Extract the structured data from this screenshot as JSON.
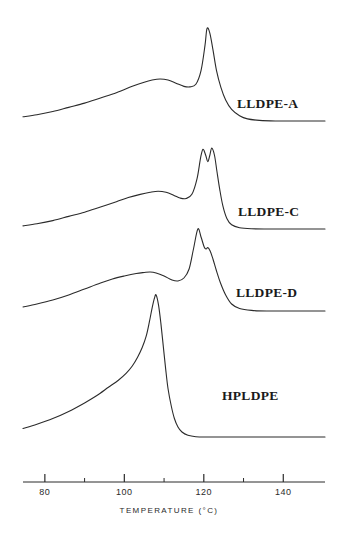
{
  "figure": {
    "title": "",
    "background_color": "#ffffff",
    "curve_color": "#2b2b2b",
    "axis_color": "#2b2b2b"
  },
  "axis": {
    "label": "TEMPERATURE (°C)",
    "major_ticks": [
      80,
      100,
      120,
      140
    ],
    "major_tick_labels": [
      "80",
      "100",
      "120",
      "140"
    ],
    "minor_ticks": [
      90,
      110,
      130
    ],
    "range": [
      74.5,
      150.5
    ]
  },
  "labels": {
    "lldpe_a": "LLDPE-A",
    "lldpe_c": "LLDPE-C",
    "lldpe_d": "LLDPE-D",
    "hpldpe": "HPLDPE"
  },
  "chart_data": {
    "type": "line",
    "title": "",
    "xlabel": "TEMPERATURE (°C)",
    "ylabel": "",
    "xlim": [
      74.5,
      150.5
    ],
    "grid": false,
    "legend": "inline-right",
    "series": [
      {
        "name": "LLDPE-A",
        "label_position": [
          115.5,
          0.0
        ],
        "peaks": [
          {
            "type": "broad-shoulder",
            "temperature": 109.0
          },
          {
            "type": "main",
            "temperature": 120.8
          }
        ],
        "x": [
          74.5,
          78,
          82,
          86,
          90,
          94,
          98,
          102,
          105,
          107,
          109,
          111,
          113,
          115,
          116.5,
          118,
          119.3,
          120.3,
          120.8,
          121.5,
          122.3,
          123.2,
          124.3,
          125.5,
          127,
          129,
          131,
          134,
          138,
          142,
          146,
          150.5
        ],
        "y": [
          4,
          6,
          9,
          13,
          17,
          22,
          27,
          33,
          37,
          39,
          40,
          39,
          36,
          33,
          32.5,
          35,
          48,
          72,
          88,
          84,
          68,
          48,
          32,
          20,
          11,
          5,
          2,
          0.6,
          0,
          0,
          0,
          0
        ]
      },
      {
        "name": "LLDPE-C",
        "label_position": [
          115.8,
          0.0
        ],
        "peaks": [
          {
            "type": "broad-shoulder",
            "temperature": 108.5
          },
          {
            "type": "doublet-low",
            "temperature": 119.8
          },
          {
            "type": "doublet-high",
            "temperature": 122.0
          }
        ],
        "x": [
          74.5,
          78,
          82,
          86,
          90,
          94,
          98,
          101,
          104,
          106.5,
          108.5,
          110.5,
          112.5,
          114,
          115.5,
          117,
          118.3,
          119.2,
          119.8,
          120.5,
          121.0,
          121.5,
          122.0,
          122.7,
          123.3,
          124.0,
          124.8,
          125.8,
          127,
          129,
          132,
          136,
          140,
          145,
          150.5
        ],
        "y": [
          3,
          5,
          8,
          12,
          16,
          21,
          26,
          30,
          33,
          35,
          36,
          35,
          32,
          29.5,
          29,
          33,
          48,
          68,
          76,
          70,
          64,
          70,
          77,
          70,
          55,
          38,
          22,
          10,
          4,
          1.2,
          0.2,
          0,
          0,
          0,
          0
        ]
      },
      {
        "name": "LLDPE-D",
        "label_position": [
          115.3,
          0.0
        ],
        "peaks": [
          {
            "type": "broad-shoulder",
            "temperature": 106.5
          },
          {
            "type": "main",
            "temperature": 118.5
          },
          {
            "type": "secondary-shoulder",
            "temperature": 121.0
          }
        ],
        "x": [
          74.5,
          78,
          82,
          86,
          90,
          94,
          97,
          100,
          103,
          105,
          106.5,
          108,
          110,
          112,
          113.5,
          115,
          116.3,
          117.4,
          118.5,
          119.3,
          120.1,
          120.6,
          121.0,
          121.6,
          122.3,
          123.2,
          124.2,
          125.5,
          127,
          129,
          132,
          136,
          141,
          146,
          150.5
        ],
        "y": [
          4,
          7,
          11,
          16,
          22,
          28,
          32,
          35,
          37.5,
          38.5,
          39,
          38,
          35,
          31,
          30,
          33,
          42,
          62,
          82,
          74,
          64,
          62,
          63.5,
          60,
          52,
          40,
          28,
          16,
          7,
          2.5,
          0.6,
          0,
          0,
          0,
          0
        ]
      },
      {
        "name": "HPLDPE",
        "label_position": [
          112.5,
          0.0
        ],
        "peaks": [
          {
            "type": "main",
            "temperature": 108.0
          }
        ],
        "x": [
          74.5,
          78,
          82,
          86,
          90,
          93,
          96,
          98.5,
          100.5,
          102,
          103.3,
          104.5,
          105.5,
          106.3,
          107.0,
          107.6,
          108.0,
          108.6,
          109.2,
          109.8,
          110.4,
          111.0,
          111.8,
          112.6,
          113.5,
          114.5,
          116,
          118,
          121,
          125,
          130,
          136,
          142,
          150.5
        ],
        "y": [
          6,
          9,
          13,
          18,
          24,
          29,
          35,
          40,
          45,
          50,
          56,
          63,
          71,
          81,
          91,
          98,
          100,
          93,
          80,
          64,
          48,
          34,
          22,
          13,
          7,
          3.5,
          1.2,
          0.2,
          0,
          0,
          0,
          0,
          0,
          0
        ]
      }
    ]
  }
}
